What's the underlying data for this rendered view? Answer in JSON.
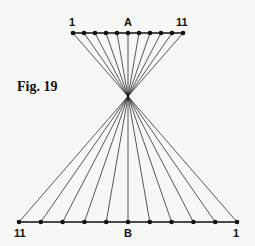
{
  "figure": {
    "caption": "Fig. 19",
    "line_a": {
      "name": "A",
      "left_label": "1",
      "right_label": "11",
      "points": 11,
      "x_start": 73,
      "x_end": 183,
      "y": 33
    },
    "line_b": {
      "name": "B",
      "left_label": "11",
      "right_label": "1",
      "points": 11,
      "x_start": 19,
      "x_end": 237,
      "y": 222
    },
    "crossing_point": {
      "x": 128,
      "y": 97
    },
    "stroke_color": "#111111",
    "background_color": "#f7f7f5"
  }
}
